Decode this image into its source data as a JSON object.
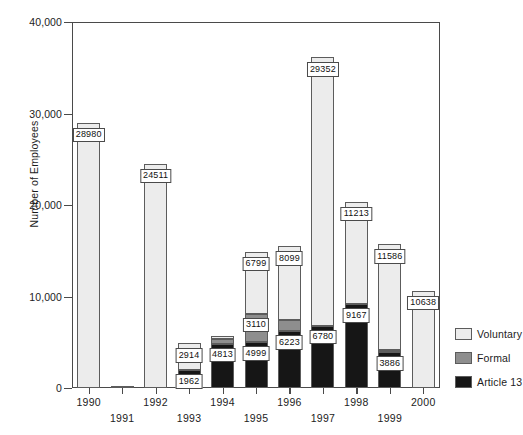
{
  "chart_data": {
    "type": "bar",
    "subtype": "stacked-vertical",
    "title": "",
    "xlabel": "",
    "ylabel": "Number of Employees",
    "ylim": [
      0,
      40000
    ],
    "yticks": [
      0,
      10000,
      20000,
      30000,
      40000
    ],
    "ytick_labels": [
      "0",
      "10,000",
      "20,000",
      "30,000",
      "40,000"
    ],
    "grid": false,
    "legend_position": "right",
    "categories": [
      "1990",
      "1991",
      "1992",
      "1993",
      "1994",
      "1995",
      "1996",
      "1997",
      "1998",
      "1999",
      "2000"
    ],
    "series": [
      {
        "name": "Article 13",
        "color": "#161616",
        "values": [
          0,
          0,
          0,
          1962,
          4813,
          4999,
          6223,
          6780,
          9167,
          3886,
          0
        ],
        "labels": [
          "",
          "",
          "",
          "1962",
          "4813",
          "4999",
          "6223",
          "6780",
          "9167",
          "3886",
          ""
        ]
      },
      {
        "name": "Formal",
        "color": "#8e8e8e",
        "values": [
          0,
          0,
          0,
          0,
          530,
          3110,
          1180,
          0,
          0,
          220,
          0
        ],
        "labels": [
          "",
          "",
          "",
          "",
          "",
          "3110",
          "",
          "",
          "",
          "",
          ""
        ]
      },
      {
        "name": "Voluntary",
        "color": "#ececec",
        "values": [
          28980,
          250,
          24511,
          2914,
          330,
          6799,
          8099,
          29352,
          11213,
          11586,
          10638
        ],
        "labels": [
          "28980",
          "",
          "24511",
          "2914",
          "4813",
          "6799",
          "8099",
          "29352",
          "11213",
          "11586",
          "10638"
        ]
      }
    ],
    "annotations": [
      {
        "category": "1990",
        "text": "28980"
      },
      {
        "category": "1992",
        "text": "24511"
      },
      {
        "category": "1993",
        "text": "2914"
      },
      {
        "category": "1993",
        "text": "1962"
      },
      {
        "category": "1994",
        "text": "4813"
      },
      {
        "category": "1995",
        "text": "6799"
      },
      {
        "category": "1995",
        "text": "3110"
      },
      {
        "category": "1995",
        "text": "4999"
      },
      {
        "category": "1996",
        "text": "8099"
      },
      {
        "category": "1996",
        "text": "6223"
      },
      {
        "category": "1997",
        "text": "29352"
      },
      {
        "category": "1997",
        "text": "6780"
      },
      {
        "category": "1998",
        "text": "11213"
      },
      {
        "category": "1998",
        "text": "9167"
      },
      {
        "category": "1999",
        "text": "11586"
      },
      {
        "category": "1999",
        "text": "3886"
      },
      {
        "category": "2000",
        "text": "10638"
      }
    ]
  },
  "axis": {
    "y_title": "Number of Employees",
    "y_ticks": [
      {
        "label": "40,000"
      },
      {
        "label": "30,000"
      },
      {
        "label": "20,000"
      },
      {
        "label": "10,000"
      },
      {
        "label": "0"
      }
    ],
    "x_ticks": [
      {
        "label": "1990",
        "row": "a"
      },
      {
        "label": "1991",
        "row": "b"
      },
      {
        "label": "1992",
        "row": "a"
      },
      {
        "label": "1993",
        "row": "b"
      },
      {
        "label": "1994",
        "row": "a"
      },
      {
        "label": "1995",
        "row": "b"
      },
      {
        "label": "1996",
        "row": "a"
      },
      {
        "label": "1997",
        "row": "b"
      },
      {
        "label": "1998",
        "row": "a"
      },
      {
        "label": "1999",
        "row": "b"
      },
      {
        "label": "2000",
        "row": "a"
      }
    ]
  },
  "legend": {
    "items": [
      {
        "label": "Voluntary",
        "color": "#ececec"
      },
      {
        "label": "Formal",
        "color": "#8e8e8e"
      },
      {
        "label": "Article 13",
        "color": "#161616"
      }
    ]
  },
  "value_labels": [
    {
      "text": "28980"
    },
    {
      "text": "24511"
    },
    {
      "text": "2914"
    },
    {
      "text": "1962"
    },
    {
      "text": "4813"
    },
    {
      "text": "6799"
    },
    {
      "text": "3110"
    },
    {
      "text": "4999"
    },
    {
      "text": "8099"
    },
    {
      "text": "6223"
    },
    {
      "text": "29352"
    },
    {
      "text": "6780"
    },
    {
      "text": "11213"
    },
    {
      "text": "9167"
    },
    {
      "text": "11586"
    },
    {
      "text": "3886"
    },
    {
      "text": "10638"
    }
  ]
}
